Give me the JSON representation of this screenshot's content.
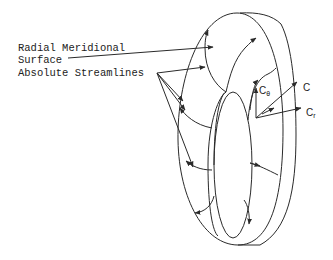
{
  "labels": {
    "radial_line1": "Radial Meridional",
    "radial_line2": "Surface",
    "streamlines": "Absolute Streamlines"
  },
  "vectors": {
    "c_theta": {
      "main": "C",
      "sub": "θ"
    },
    "c": {
      "main": "C"
    },
    "c_r": {
      "main": "C",
      "sub": "r"
    }
  },
  "colors": {
    "stroke": "#2a2a2a",
    "background": "#ffffff"
  }
}
